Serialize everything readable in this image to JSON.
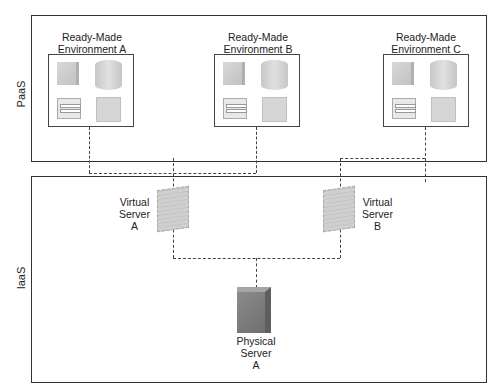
{
  "layers": {
    "paas": {
      "label": "PaaS"
    },
    "iaas": {
      "label": "IaaS"
    }
  },
  "environments": [
    {
      "title_line1": "Ready-Made",
      "title_line2": "Environment A"
    },
    {
      "title_line1": "Ready-Made",
      "title_line2": "Environment B"
    },
    {
      "title_line1": "Ready-Made",
      "title_line2": "Environment C"
    }
  ],
  "virtual_servers": [
    {
      "line1": "Virtual",
      "line2": "Server",
      "line3": "A"
    },
    {
      "line1": "Virtual",
      "line2": "Server",
      "line3": "B"
    }
  ],
  "physical_server": {
    "line1": "Physical",
    "line2": "Server",
    "line3": "A"
  },
  "colors": {
    "border": "#333333",
    "server_dark": "#7a7a7a",
    "server_light": "#cccccc"
  }
}
